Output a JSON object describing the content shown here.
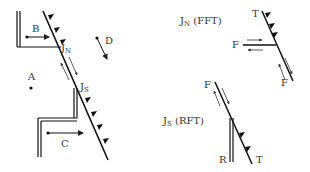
{
  "diagram": {
    "type": "fault-junction schematic",
    "main": {
      "labels": {
        "A": "A",
        "B": "B",
        "C": "C",
        "D": "D",
        "JN": "J",
        "JN_sub": "N",
        "JS": "J",
        "JS_sub": "S"
      }
    },
    "inset_top": {
      "title": "J",
      "title_sub": "N",
      "title_suffix": " (FFT)",
      "labels": {
        "T": "T",
        "F_left": "F",
        "F_bottom": "F"
      }
    },
    "inset_bottom": {
      "title": "J",
      "title_sub": "S",
      "title_suffix": " (RFT)",
      "labels": {
        "F": "F",
        "R": "R",
        "T": "T"
      }
    }
  }
}
